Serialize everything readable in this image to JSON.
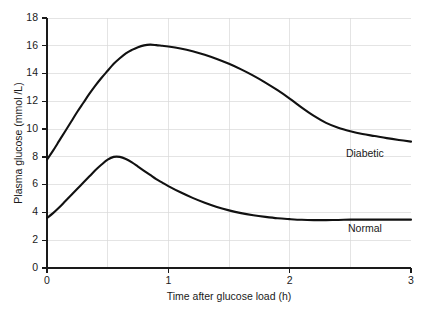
{
  "chart_data": {
    "type": "line",
    "title": "",
    "xlabel": "Time after glucose load (h)",
    "ylabel": "Plasma glucose (mmol /L)",
    "xlim": [
      0,
      3
    ],
    "ylim": [
      0,
      18
    ],
    "xticks": [
      0,
      1,
      2,
      3
    ],
    "xticklabels": [
      "0",
      "1",
      "2",
      "3"
    ],
    "yticks": [
      0,
      2,
      4,
      6,
      8,
      10,
      12,
      14,
      16,
      18
    ],
    "yticklabels": [
      "0",
      "2",
      "4",
      "6",
      "8",
      "10",
      "12",
      "14",
      "16",
      "18"
    ],
    "grid": true,
    "grid_x": [
      0.5,
      1,
      1.5,
      2,
      2.5
    ],
    "grid_y": [
      2,
      4,
      6,
      8,
      10,
      12,
      14,
      16,
      18
    ],
    "legend_position": "inline-annotation",
    "line_color": "#111111",
    "grid_color": "#d9d9d9",
    "axis_color": "#1a1a1a",
    "series": [
      {
        "name": "Diabetic",
        "label_x": 2.62,
        "label_y": 8.0,
        "x": [
          0.0,
          0.05,
          0.1,
          0.15,
          0.2,
          0.25,
          0.3,
          0.35,
          0.4,
          0.45,
          0.5,
          0.55,
          0.6,
          0.65,
          0.7,
          0.75,
          0.8,
          0.85,
          0.9,
          0.95,
          1.0,
          1.1,
          1.2,
          1.3,
          1.4,
          1.5,
          1.6,
          1.7,
          1.8,
          1.9,
          2.0,
          2.1,
          2.2,
          2.3,
          2.4,
          2.5,
          2.6,
          2.7,
          2.8,
          2.9,
          3.0
        ],
        "y": [
          7.8,
          8.45,
          9.15,
          9.85,
          10.55,
          11.25,
          11.9,
          12.55,
          13.15,
          13.7,
          14.2,
          14.7,
          15.1,
          15.45,
          15.7,
          15.9,
          16.03,
          16.08,
          16.05,
          16.0,
          15.95,
          15.8,
          15.6,
          15.35,
          15.05,
          14.7,
          14.3,
          13.85,
          13.35,
          12.8,
          12.2,
          11.55,
          10.95,
          10.45,
          10.1,
          9.85,
          9.65,
          9.5,
          9.35,
          9.22,
          9.1
        ]
      },
      {
        "name": "Normal",
        "label_x": 2.62,
        "label_y": 2.6,
        "x": [
          0.0,
          0.05,
          0.1,
          0.15,
          0.2,
          0.25,
          0.3,
          0.35,
          0.4,
          0.45,
          0.5,
          0.55,
          0.6,
          0.65,
          0.7,
          0.75,
          0.8,
          0.85,
          0.9,
          0.95,
          1.0,
          1.1,
          1.2,
          1.3,
          1.4,
          1.5,
          1.6,
          1.7,
          1.8,
          1.9,
          2.0,
          2.1,
          2.2,
          2.3,
          2.4,
          2.5,
          2.6,
          2.7,
          2.8,
          2.9,
          3.0
        ],
        "y": [
          3.6,
          3.95,
          4.35,
          4.8,
          5.25,
          5.7,
          6.15,
          6.6,
          7.05,
          7.45,
          7.8,
          8.0,
          8.0,
          7.85,
          7.6,
          7.3,
          7.0,
          6.7,
          6.4,
          6.15,
          5.9,
          5.45,
          5.05,
          4.7,
          4.4,
          4.15,
          3.95,
          3.8,
          3.68,
          3.58,
          3.52,
          3.47,
          3.45,
          3.45,
          3.46,
          3.48,
          3.48,
          3.48,
          3.48,
          3.48,
          3.48
        ]
      }
    ]
  }
}
